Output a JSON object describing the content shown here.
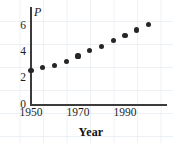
{
  "chart_data": {
    "type": "scatter",
    "title": "",
    "xlabel": "Year",
    "ylabel": "P",
    "x": [
      1950,
      1955,
      1960,
      1965,
      1970,
      1975,
      1980,
      1985,
      1990,
      1995,
      2000
    ],
    "values": [
      2.6,
      2.8,
      3.0,
      3.3,
      3.7,
      4.1,
      4.45,
      4.9,
      5.3,
      5.7,
      6.1
    ],
    "xlim": [
      1950,
      2005
    ],
    "ylim": [
      0,
      6.9
    ],
    "x_ticks": [
      1950,
      1970,
      1990
    ],
    "x_tick_labels": [
      "1950",
      "1970",
      "1990"
    ],
    "y_ticks": [
      0,
      2,
      4,
      6
    ],
    "y_tick_labels": [
      "0",
      "2",
      "4",
      "6"
    ],
    "grid": true,
    "grid_style": "light-blue graph paper background",
    "legend": null,
    "marker": "filled-circle",
    "marker_color": "#262626",
    "axis_color": "#3b3b3b",
    "background_color": "#ffffff"
  },
  "axes": {
    "y_axis_variable": "P",
    "x_axis_title": "Year"
  }
}
